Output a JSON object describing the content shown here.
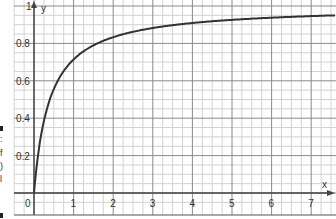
{
  "chart_data": {
    "type": "line",
    "title": "",
    "xlabel": "x",
    "ylabel": "y",
    "xlim": [
      0,
      7.5
    ],
    "ylim": [
      0,
      1
    ],
    "grid": true,
    "x_ticks": [
      "0",
      "1",
      "2",
      "3",
      "4",
      "5",
      "6",
      "7"
    ],
    "y_ticks": [
      "0.2",
      "0.4",
      "0.6",
      "0.8",
      "1"
    ],
    "series": [
      {
        "name": "curve",
        "x": [
          0,
          0.05,
          0.1,
          0.2,
          0.3,
          0.5,
          0.75,
          1,
          1.5,
          2,
          2.5,
          3,
          4,
          5,
          6,
          7,
          7.5
        ],
        "y": [
          0,
          0.11,
          0.2,
          0.33,
          0.43,
          0.56,
          0.65,
          0.71,
          0.79,
          0.83,
          0.86,
          0.88,
          0.91,
          0.93,
          0.94,
          0.95,
          0.95
        ]
      }
    ],
    "colors": {
      "curve": "#333333",
      "grid_major": "#8a8a8a",
      "grid_minor": "#d2d2d2",
      "axis": "#444444"
    }
  },
  "axes": {
    "x_label": "x",
    "y_label": "y"
  },
  "edge_fragments": [
    ":",
    "f",
    ")",
    "l"
  ]
}
